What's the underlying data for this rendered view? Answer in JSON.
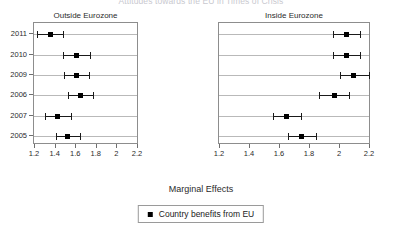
{
  "chart_data": {
    "type": "scatter",
    "title": "Attitudes towards the EU in Times of Crisis",
    "xlabel": "Marginal Effects",
    "ylabel": "",
    "xlim": [
      1.2,
      2.2
    ],
    "xticks": [
      1.2,
      1.4,
      1.6,
      1.8,
      2.0,
      2.2
    ],
    "xticklabels": [
      "1.2",
      "1.4",
      "1.6",
      "1.8",
      "2",
      "2.2"
    ],
    "grid": true,
    "legend_position": "bottom",
    "legend": [
      "Country benefits from EU"
    ],
    "categories": [
      "2011",
      "2010",
      "2009",
      "2006",
      "2007",
      "2005"
    ],
    "panels": [
      {
        "name": "Outside Eurozone",
        "values": [
          1.35,
          1.6,
          1.6,
          1.64,
          1.42,
          1.52
        ],
        "ci_low": [
          1.22,
          1.47,
          1.48,
          1.52,
          1.3,
          1.4
        ],
        "ci_high": [
          1.47,
          1.73,
          1.72,
          1.76,
          1.55,
          1.64
        ]
      },
      {
        "name": "Inside Eurozone",
        "values": [
          2.04,
          2.04,
          2.09,
          1.96,
          1.64,
          1.74
        ],
        "ci_low": [
          1.95,
          1.95,
          2.0,
          1.86,
          1.55,
          1.65
        ],
        "ci_high": [
          2.13,
          2.13,
          2.19,
          2.06,
          1.74,
          1.84
        ]
      }
    ]
  },
  "legend": {
    "label": "Country benefits from EU"
  }
}
